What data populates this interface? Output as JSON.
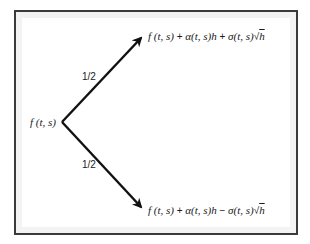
{
  "diagram": {
    "type": "binomial-tree",
    "root": {
      "label": "f (t, s)"
    },
    "branches": [
      {
        "direction": "up",
        "probability": "1/2",
        "node": {
          "label": "f (t, s) + α(t, s)h + σ(t, s)√h",
          "parts": {
            "f": "f (t, s)",
            "plus1": "+",
            "drift": "α(t, s)h",
            "op": "+",
            "vol": "σ(t, s)",
            "sqrt_sign": "√",
            "sqrt_arg": "h"
          }
        }
      },
      {
        "direction": "down",
        "probability": "1/2",
        "node": {
          "label": "f (t, s) + α(t, s)h − σ(t, s)√h",
          "parts": {
            "f": "f (t, s)",
            "plus1": "+",
            "drift": "α(t, s)h",
            "op": "−",
            "vol": "σ(t, s)",
            "sqrt_sign": "√",
            "sqrt_arg": "h"
          }
        }
      }
    ],
    "colors": {
      "frame": "#3a3a3a",
      "frame_inset": "#f3f3f3",
      "arrow": "#111111",
      "text": "#1a1a1a"
    }
  }
}
